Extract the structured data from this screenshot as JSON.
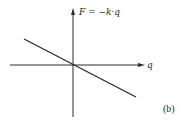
{
  "diagram": {
    "y_axis_label": "F = −k·q",
    "x_axis_label": "q",
    "panel_label": "(b)",
    "line": {
      "from": [
        -1,
        0.52
      ],
      "to": [
        1,
        -0.52
      ],
      "description": "linear restoring force, negative slope through origin"
    },
    "colors": {
      "ink": "#2a2a2a",
      "background": "#ffffff"
    }
  }
}
